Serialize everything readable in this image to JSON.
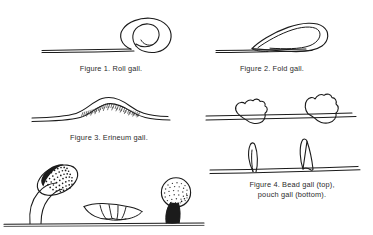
{
  "plate": {
    "title": "Leaf gall types plate",
    "background_color": "#ffffff",
    "ink_color": "#1b1b1b",
    "figure_count": 4,
    "captions": [
      {
        "id": "figure-1",
        "text": "Figure 1. Roll gall."
      },
      {
        "id": "figure-2",
        "text": "Figure 2. Fold gall."
      },
      {
        "id": "figure-3",
        "text": "Figure 3. Erineum gall."
      },
      {
        "id": "figure-4",
        "text": "Figure 4. Bead gall (top),\npouch gall (bottom)."
      }
    ],
    "figures": [
      {
        "id": "figure-1",
        "name": "roll-gall",
        "label": "Figure 1. Roll gall.",
        "description": "Leaf blade shown in cross-section with the margin rolled into a tight spiral coil."
      },
      {
        "id": "figure-2",
        "name": "fold-gall",
        "label": "Figure 2. Fold gall.",
        "description": "Leaf margin folded over on itself forming an elongated teardrop pocket."
      },
      {
        "id": "figure-3",
        "name": "erineum-gall",
        "label": "Figure 3. Erineum gall.",
        "description": "Low broad blister in the leaf blade with a dense felt of short hairs on the surface."
      },
      {
        "id": "figure-4",
        "name": "bead-and-pouch-gall",
        "label": "Figure 4. Bead gall (top), pouch gall (bottom).",
        "parts": [
          {
            "name": "bead-gall",
            "position": "top",
            "description": "Two irregular lumpy beads straddling the leaf blade."
          },
          {
            "name": "pouch-gall",
            "position": "bottom",
            "description": "Two narrow curved pouches projecting upward from the leaf blade."
          }
        ]
      },
      {
        "id": "figure-unlabeled-bottom",
        "name": "stalked-gall-row",
        "label": "",
        "description": "Uncaptioned bottom row of three gall forms on a common ground line.",
        "parts": [
          {
            "name": "dark-stalked-ovoid-gall",
            "position": "left",
            "description": "Dark stippled ovoid head tilted on a slender curved stalk."
          },
          {
            "name": "fringed-rosette-gall",
            "position": "center",
            "description": "Low spreading rosette of pointed lobes lying against the surface."
          },
          {
            "name": "pale-capitate-gall",
            "position": "right",
            "description": "Pale stippled round head on a short dark tapering trunk."
          }
        ]
      }
    ]
  }
}
